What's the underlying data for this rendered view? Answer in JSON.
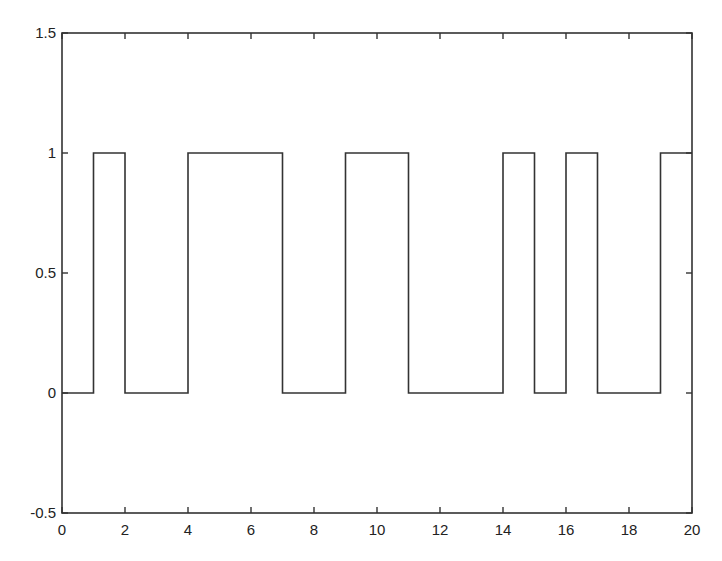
{
  "chart_data": {
    "type": "line",
    "subtype": "step",
    "title": "",
    "xlabel": "",
    "ylabel": "",
    "xlim": [
      0,
      20
    ],
    "ylim": [
      -0.5,
      1.5
    ],
    "grid": false,
    "legend": null,
    "xticks": [
      0,
      2,
      4,
      6,
      8,
      10,
      12,
      14,
      16,
      18,
      20
    ],
    "xtick_labels": [
      "0",
      "2",
      "4",
      "6",
      "8",
      "10",
      "12",
      "14",
      "16",
      "18",
      "20"
    ],
    "yticks": [
      -0.5,
      0,
      0.5,
      1,
      1.5
    ],
    "ytick_labels": [
      "-0.5",
      "0",
      "0.5",
      "1",
      "1.5"
    ],
    "series": [
      {
        "name": "signal",
        "color": "#333333",
        "x": [
          0,
          1,
          1,
          2,
          2,
          4,
          4,
          7,
          7,
          9,
          9,
          11,
          11,
          14,
          14,
          15,
          15,
          16,
          16,
          17,
          17,
          19,
          19,
          20
        ],
        "y": [
          0,
          0,
          1,
          1,
          0,
          0,
          1,
          1,
          0,
          0,
          1,
          1,
          0,
          0,
          1,
          1,
          0,
          0,
          1,
          1,
          0,
          0,
          1,
          1
        ]
      }
    ],
    "interval_values": {
      "t": [
        0,
        1,
        2,
        3,
        4,
        5,
        6,
        7,
        8,
        9,
        10,
        11,
        12,
        13,
        14,
        15,
        16,
        17,
        18,
        19
      ],
      "value": [
        0,
        1,
        0,
        0,
        1,
        1,
        1,
        0,
        0,
        1,
        1,
        0,
        0,
        0,
        1,
        0,
        1,
        0,
        0,
        1
      ]
    }
  },
  "style": {
    "axis_color": "#333333",
    "line_color": "#333333",
    "background": "#ffffff"
  }
}
